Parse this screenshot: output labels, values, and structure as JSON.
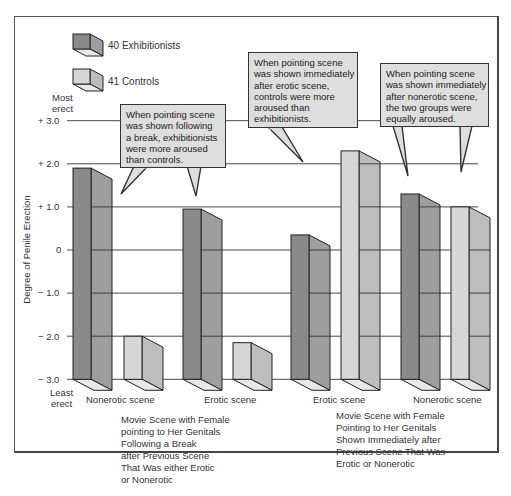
{
  "legend": {
    "exhibitionists": "40 Exhibitionists",
    "controls": "41 Controls"
  },
  "axis": {
    "top_label_1": "Most",
    "top_label_2": "erect",
    "bottom_label_1": "Least",
    "bottom_label_2": "erect",
    "ylabel": "Degree of Penile Erection",
    "ticks": [
      "+ 3.0",
      "+ 2.0",
      "+ 1.0",
      "0",
      "− 1.0",
      "− 2.0",
      "− 3.0"
    ]
  },
  "callouts": {
    "break": "When pointing scene\nwas shown following\na break, exhibitionists\nwere more aroused\nthan controls.",
    "erotic": "When pointing scene\nwas shown immediately\nafter erotic scene,\ncontrols were more\naroused than\nexhibitionists.",
    "nonerotic": "When pointing scene\nwas shown immediately\nafter nonerotic scene,\nthe two groups were\nequally aroused."
  },
  "xlabels": {
    "g1": "Nonerotic scene",
    "g2": "Erotic scene",
    "g3": "Erotic scene",
    "g4": "Nonerotic scene"
  },
  "captions": {
    "left": "Movie Scene with Female\npointing to Her Genitals\nFollowing a Break\nafter Previous Scene\nThat Was either Erotic\nor Nonerotic",
    "right": "Movie Scene with Female\nPointing to Her Genitals\nShown Immediately after\nPrevious Scene That Was\nErotic or Nonerotic"
  },
  "colors": {
    "exh_front": "#8a8a8a",
    "exh_side": "#9e9e9e",
    "ctrl_front": "#d6d6d6",
    "ctrl_side": "#bdbdbd",
    "callout_bg": "#dedede"
  },
  "chart_data": {
    "type": "bar",
    "title": "",
    "ylabel": "Degree of Penile Erection",
    "xlabel": "",
    "ylim": [
      -3.0,
      3.0
    ],
    "yticks": [
      3.0,
      2.0,
      1.0,
      0,
      -1.0,
      -2.0,
      -3.0
    ],
    "grid": true,
    "legend_position": "top-left",
    "categories": [
      "Following a Break: Nonerotic scene",
      "Following a Break: Erotic scene",
      "Immediately after: Erotic scene",
      "Immediately after: Nonerotic scene"
    ],
    "series": [
      {
        "name": "40 Exhibitionists",
        "values": [
          1.9,
          0.95,
          0.35,
          1.3
        ]
      },
      {
        "name": "41 Controls",
        "values": [
          -2.0,
          -2.15,
          2.3,
          1.0
        ]
      }
    ],
    "annotations": [
      "When pointing scene was shown following a break, exhibitionists were more aroused than controls.",
      "When pointing scene was shown immediately after erotic scene, controls were more aroused than exhibitionists.",
      "When pointing scene was shown immediately after nonerotic scene, the two groups were equally aroused."
    ],
    "group_labels": [
      "Movie Scene with Female pointing to Her Genitals Following a Break after Previous Scene That Was either Erotic or Nonerotic",
      "Movie Scene with Female Pointing to Her Genitals Shown Immediately after Previous Scene That Was Erotic or Nonerotic"
    ]
  }
}
